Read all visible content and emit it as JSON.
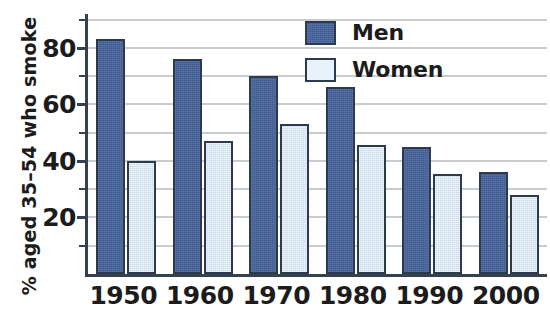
{
  "chart_data": {
    "type": "bar",
    "title": "",
    "subtitle": "",
    "xlabel": "",
    "ylabel": "% aged 35–54 who smoke",
    "categories": [
      "1950",
      "1960",
      "1970",
      "1980",
      "1990",
      "2000"
    ],
    "series": [
      {
        "name": "Men",
        "color": "#46639c",
        "values": [
          83,
          76,
          70,
          66,
          45,
          36
        ]
      },
      {
        "name": "Women",
        "color": "#dbeaf5",
        "values": [
          40,
          47,
          53,
          45.5,
          35.5,
          28
        ]
      }
    ],
    "ylim": [
      0,
      92
    ],
    "ytick_labels": [
      "20",
      "40",
      "60",
      "80"
    ],
    "ytick_values": [
      20,
      40,
      60,
      80
    ],
    "yminor_values": [
      10,
      30,
      50,
      70,
      90
    ],
    "gridlines": [
      10,
      20,
      30,
      40,
      50,
      60,
      70,
      80,
      90
    ],
    "grid": true,
    "grid_color": "#c9ccce",
    "axis_color": "#35414f",
    "bar_edge_color": "#2d3a4d",
    "legend_position": "top-right",
    "legend": [
      "Men",
      "Women"
    ],
    "background": "#ffffff"
  }
}
